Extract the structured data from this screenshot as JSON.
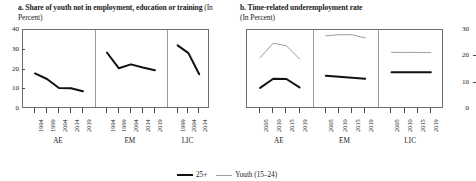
{
  "figure": {
    "legend": [
      {
        "name": "legend-25plus",
        "label": "25+",
        "color": "#111111",
        "style": "thick"
      },
      {
        "name": "legend-youth",
        "label": "Youth (15–24)",
        "color": "#9d9d9d",
        "style": "thin"
      }
    ]
  },
  "panel_a": {
    "title": "a. Share of youth not in employment,",
    "title_line2": "education or training",
    "unit": "(In Percent)",
    "ylabels": [
      "40",
      "30",
      "20",
      "10",
      "0"
    ],
    "groups": [
      "AE",
      "EM",
      "LIC"
    ]
  },
  "panel_b": {
    "title": "b. Time-related underemployment rate",
    "title_line2": "",
    "unit": "(In Percent)",
    "ylabels": [
      "30",
      "20",
      "10",
      "0"
    ],
    "groups": [
      "AE",
      "EM",
      "LIC"
    ]
  },
  "chart_data": [
    {
      "id": "panel-a",
      "type": "line",
      "title": "a. Share of youth not in employment, education or training (In Percent)",
      "xlabel": "",
      "ylabel": "In Percent",
      "ylim": [
        0,
        40
      ],
      "yticks": [
        0,
        10,
        20,
        30,
        40
      ],
      "grid": false,
      "legend_position": "bottom-shared",
      "panels": [
        {
          "group": "AE",
          "x": [
            "1994",
            "1999",
            "2004",
            "2014",
            "2019"
          ],
          "series": [
            {
              "name": "Youth NEET",
              "values": [
                18.0,
                15.2,
                10.6,
                10.5,
                9.0
              ],
              "color": "#111111",
              "style": "thick"
            }
          ]
        },
        {
          "group": "EM",
          "x": [
            "1994",
            "1999",
            "2004",
            "2014",
            "2019"
          ],
          "series": [
            {
              "name": "Youth NEET",
              "values": [
                28.6,
                20.6,
                22.6,
                21.0,
                19.6
              ],
              "color": "#111111",
              "style": "thick"
            }
          ]
        },
        {
          "group": "LIC",
          "x": [
            "1999",
            "2004",
            "2014"
          ],
          "series": [
            {
              "name": "Youth NEET",
              "values": [
                32.2,
                28.3,
                17.6
              ],
              "color": "#111111",
              "style": "thick"
            }
          ]
        }
      ]
    },
    {
      "id": "panel-b",
      "type": "line",
      "title": "b. Time-related underemployment rate (In Percent)",
      "xlabel": "",
      "ylabel": "In Percent",
      "ylim": [
        0,
        30
      ],
      "yticks": [
        0,
        10,
        20,
        30
      ],
      "grid": false,
      "legend_position": "bottom-shared",
      "panels": [
        {
          "group": "AE",
          "x": [
            "2005",
            "2010",
            "2015",
            "2019"
          ],
          "series": [
            {
              "name": "25+",
              "values": [
                8.0,
                11.5,
                11.4,
                8.2
              ],
              "color": "#111111",
              "style": "thick"
            },
            {
              "name": "Youth (15–24)",
              "values": [
                19.5,
                25.0,
                24.0,
                19.0
              ],
              "color": "#9d9d9d",
              "style": "thin"
            }
          ]
        },
        {
          "group": "EM",
          "x": [
            "2005",
            "2010",
            "2015",
            "2019"
          ],
          "series": [
            {
              "name": "25+",
              "values": [
                12.6,
                12.2,
                11.9,
                11.5
              ],
              "color": "#111111",
              "style": "thick"
            },
            {
              "name": "Youth (15–24)",
              "values": [
                27.8,
                28.2,
                28.2,
                27.0
              ],
              "color": "#9d9d9d",
              "style": "thin"
            }
          ]
        },
        {
          "group": "LIC",
          "x": [
            "2005",
            "2010",
            "2015",
            "2019"
          ],
          "series": [
            {
              "name": "25+",
              "values": [
                14.0,
                14.0,
                14.0,
                14.0
              ],
              "color": "#111111",
              "style": "thick"
            },
            {
              "name": "Youth (15–24)",
              "values": [
                21.5,
                21.5,
                21.5,
                21.4
              ],
              "color": "#9d9d9d",
              "style": "thin"
            }
          ]
        }
      ]
    }
  ]
}
